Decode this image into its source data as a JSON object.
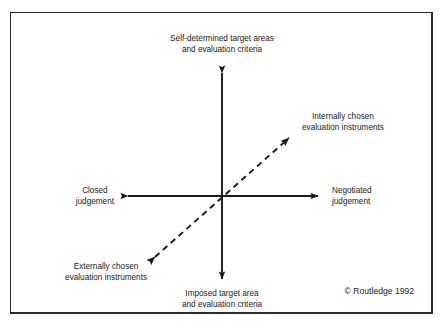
{
  "figure": {
    "type": "two-axis-conceptual-matrix",
    "background_color": "#ffffff",
    "frame_color": "#2b2b2b",
    "line_color": "#1a1a1a",
    "axes": {
      "vertical": {
        "style": "solid",
        "arrowheads": "both",
        "top_label": {
          "line1": "Self-determined target areas",
          "line2": "and evaluation criteria"
        },
        "bottom_label": {
          "line1": "Imposed target area",
          "line2": "and evaluation criteria"
        }
      },
      "horizontal": {
        "style": "solid",
        "arrowheads": "both",
        "left_label": {
          "line1": "Closed",
          "line2": "judgement"
        },
        "right_label": {
          "line1": "Negotiated",
          "line2": "judgement"
        }
      },
      "diagonal": {
        "style": "dashed",
        "arrowheads": "both",
        "upper_right_label": {
          "line1": "Internally chosen",
          "line2": "evaluation instruments"
        },
        "lower_left_label": {
          "line1": "Externally chosen",
          "line2": "evaluation instruments"
        }
      }
    },
    "copyright": "© Routledge 1992"
  }
}
